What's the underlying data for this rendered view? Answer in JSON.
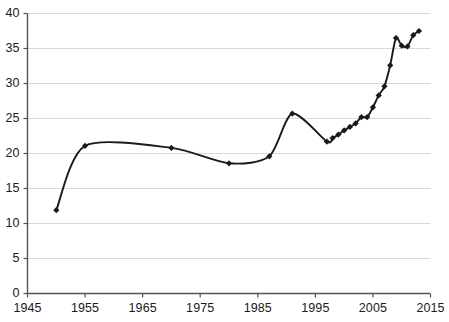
{
  "chart_data": {
    "type": "line",
    "title": "",
    "subtitle": "",
    "xlabel": "",
    "ylabel": "",
    "xlim": [
      1945,
      2015
    ],
    "ylim": [
      0,
      40
    ],
    "grid": true,
    "legend": null,
    "legend_position": "none",
    "marker": "diamond",
    "line_color": "#1a1a1a",
    "marker_color": "#1a1a1a",
    "grid_color": "#d9d9d9",
    "axis_color": "#555555",
    "background_color": "#ffffff",
    "x_ticks": [
      1945,
      1955,
      1965,
      1975,
      1985,
      1995,
      2005,
      2015
    ],
    "x_tick_labels": [
      "1945",
      "1955",
      "1965",
      "1975",
      "1985",
      "1995",
      "2005",
      "2015"
    ],
    "y_ticks": [
      0,
      5,
      10,
      15,
      20,
      25,
      30,
      35,
      40
    ],
    "y_tick_labels": [
      "0",
      "5",
      "10",
      "15",
      "20",
      "25",
      "30",
      "35",
      "40"
    ],
    "series": [
      {
        "name": "series-1",
        "points": [
          {
            "x": 1950,
            "y": 11.9
          },
          {
            "x": 1955,
            "y": 21.1
          },
          {
            "x": 1970,
            "y": 20.8
          },
          {
            "x": 1980,
            "y": 18.6
          },
          {
            "x": 1987,
            "y": 19.6
          },
          {
            "x": 1991,
            "y": 25.7
          },
          {
            "x": 1997,
            "y": 21.7
          },
          {
            "x": 1998,
            "y": 22.2
          },
          {
            "x": 1999,
            "y": 22.7
          },
          {
            "x": 2000,
            "y": 23.3
          },
          {
            "x": 2001,
            "y": 23.8
          },
          {
            "x": 2002,
            "y": 24.3
          },
          {
            "x": 2003,
            "y": 25.2
          },
          {
            "x": 2004,
            "y": 25.2
          },
          {
            "x": 2005,
            "y": 26.6
          },
          {
            "x": 2006,
            "y": 28.3
          },
          {
            "x": 2007,
            "y": 29.6
          },
          {
            "x": 2008,
            "y": 32.6
          },
          {
            "x": 2009,
            "y": 36.5
          },
          {
            "x": 2010,
            "y": 35.4
          },
          {
            "x": 2011,
            "y": 35.3
          },
          {
            "x": 2012,
            "y": 36.9
          },
          {
            "x": 2013,
            "y": 37.5
          }
        ]
      }
    ]
  }
}
